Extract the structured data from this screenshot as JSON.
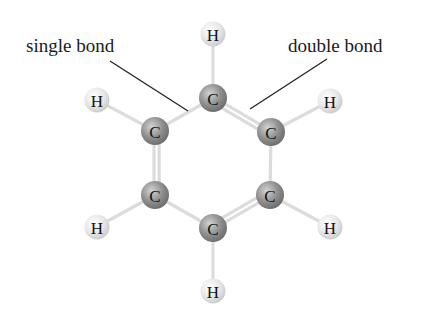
{
  "diagram": {
    "labels": {
      "single_bond": "single bond",
      "double_bond": "double bond"
    },
    "atoms": [
      {
        "id": "H1",
        "element": "H",
        "x": 213,
        "y": 34
      },
      {
        "id": "C1",
        "element": "C",
        "x": 213,
        "y": 98
      },
      {
        "id": "C2",
        "element": "C",
        "x": 271,
        "y": 132
      },
      {
        "id": "C3",
        "element": "C",
        "x": 270,
        "y": 195
      },
      {
        "id": "C4",
        "element": "C",
        "x": 213,
        "y": 228
      },
      {
        "id": "C5",
        "element": "C",
        "x": 155,
        "y": 195
      },
      {
        "id": "C6",
        "element": "C",
        "x": 155,
        "y": 131
      },
      {
        "id": "H2",
        "element": "H",
        "x": 330,
        "y": 101
      },
      {
        "id": "H3",
        "element": "H",
        "x": 330,
        "y": 227
      },
      {
        "id": "H4",
        "element": "H",
        "x": 213,
        "y": 291
      },
      {
        "id": "H5",
        "element": "H",
        "x": 97,
        "y": 227
      },
      {
        "id": "H6",
        "element": "H",
        "x": 97,
        "y": 100
      }
    ],
    "bonds": [
      {
        "a": "C1",
        "b": "C2",
        "order": 2
      },
      {
        "a": "C2",
        "b": "C3",
        "order": 1
      },
      {
        "a": "C3",
        "b": "C4",
        "order": 2
      },
      {
        "a": "C4",
        "b": "C5",
        "order": 1
      },
      {
        "a": "C5",
        "b": "C6",
        "order": 2
      },
      {
        "a": "C6",
        "b": "C1",
        "order": 1
      },
      {
        "a": "C1",
        "b": "H1",
        "order": 1
      },
      {
        "a": "C2",
        "b": "H2",
        "order": 1
      },
      {
        "a": "C3",
        "b": "H3",
        "order": 1
      },
      {
        "a": "C4",
        "b": "H4",
        "order": 1
      },
      {
        "a": "C5",
        "b": "H5",
        "order": 1
      },
      {
        "a": "C6",
        "b": "H6",
        "order": 1
      }
    ],
    "colors": {
      "carbon": "#8a8a8a",
      "hydrogen": "#e2e2e2",
      "bond": "#dcdcdc",
      "leader_line": "#222222"
    }
  }
}
